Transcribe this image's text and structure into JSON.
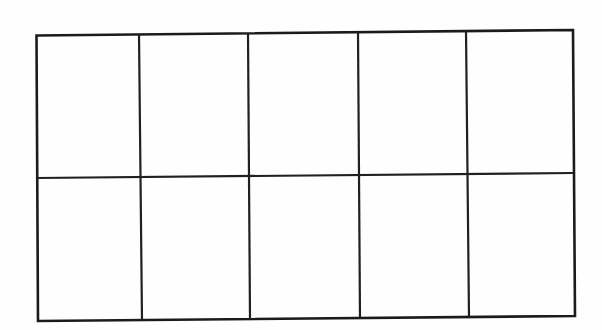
{
  "figure": {
    "kind": "hand-drawn-grid-diagram",
    "title": "",
    "caption": "",
    "background_color": "#fefefe",
    "ink_color": "#1b1b1b",
    "stroke_width_px": 2.6,
    "rows": 2,
    "columns": 5,
    "total_cells": 10,
    "cells_empty": true
  },
  "geometry": {
    "outer_rect": {
      "top_left": [
        36,
        35
      ],
      "top_right": [
        573,
        30
      ],
      "bottom_right": [
        575,
        316
      ],
      "bottom_left": [
        38,
        321
      ]
    },
    "vertical_dividers": [
      {
        "name": "divider-1",
        "top": [
          139,
          34
        ],
        "bottom": [
          142,
          320
        ]
      },
      {
        "name": "divider-2",
        "top": [
          248,
          33
        ],
        "bottom": [
          250,
          319
        ]
      },
      {
        "name": "divider-3",
        "top": [
          358,
          32
        ],
        "bottom": [
          360,
          318
        ]
      },
      {
        "name": "divider-4",
        "top": [
          466,
          31
        ],
        "bottom": [
          469,
          317
        ]
      }
    ],
    "horizontal_dividers": [
      {
        "name": "divider-mid",
        "left": [
          37,
          178
        ],
        "right": [
          574,
          173
        ]
      }
    ],
    "tilt_degrees": -0.53
  },
  "cells": [
    {
      "id": "r1c1",
      "row": 1,
      "col": 1,
      "label": ""
    },
    {
      "id": "r1c2",
      "row": 1,
      "col": 2,
      "label": ""
    },
    {
      "id": "r1c3",
      "row": 1,
      "col": 3,
      "label": ""
    },
    {
      "id": "r1c4",
      "row": 1,
      "col": 4,
      "label": ""
    },
    {
      "id": "r1c5",
      "row": 1,
      "col": 5,
      "label": ""
    },
    {
      "id": "r2c1",
      "row": 2,
      "col": 1,
      "label": ""
    },
    {
      "id": "r2c2",
      "row": 2,
      "col": 2,
      "label": ""
    },
    {
      "id": "r2c3",
      "row": 2,
      "col": 3,
      "label": ""
    },
    {
      "id": "r2c4",
      "row": 2,
      "col": 4,
      "label": ""
    },
    {
      "id": "r2c5",
      "row": 2,
      "col": 5,
      "label": ""
    }
  ]
}
